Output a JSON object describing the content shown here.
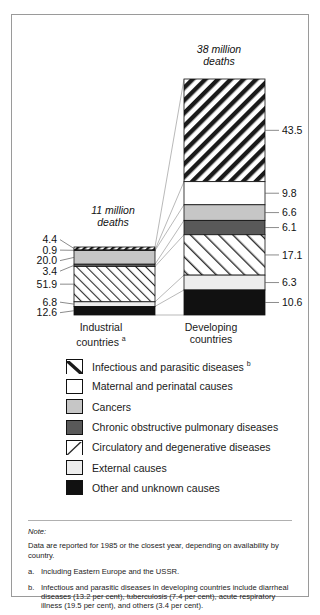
{
  "chart_data": {
    "type": "bar",
    "title": "",
    "subtitle": "",
    "xlabel": "",
    "ylabel": "",
    "stacked": true,
    "units": "per cent of deaths",
    "grid": false,
    "legend_position": "below",
    "categories": [
      "Industrial countries",
      "Developing countries"
    ],
    "category_notes": [
      "a",
      ""
    ],
    "totals": [
      "11 million deaths",
      "38 million deaths"
    ],
    "total_values": [
      11,
      38
    ],
    "series": [
      {
        "name": "Infectious and parasitic diseases",
        "note": "b",
        "pattern": "thick-backslash-hatch",
        "values": [
          4.4,
          43.5
        ]
      },
      {
        "name": "Maternal and perinatal causes",
        "note": "",
        "pattern": "white",
        "values": [
          0.9,
          9.8
        ]
      },
      {
        "name": "Cancers",
        "note": "",
        "pattern": "light-gray",
        "values": [
          20.0,
          6.6
        ]
      },
      {
        "name": "Chronic obstructive pulmonary diseases",
        "note": "",
        "pattern": "dark-gray",
        "values": [
          3.4,
          6.1
        ]
      },
      {
        "name": "Circulatory and degenerative diseases",
        "note": "",
        "pattern": "thin-slash-hatch",
        "values": [
          51.9,
          17.1
        ]
      },
      {
        "name": "External causes",
        "note": "",
        "pattern": "very-light-gray",
        "values": [
          6.8,
          6.3
        ]
      },
      {
        "name": "Other and unknown causes",
        "note": "",
        "pattern": "black",
        "values": [
          12.6,
          10.6
        ]
      }
    ]
  },
  "notes": {
    "heading": "Note:",
    "body": "Data are reported for 1985 or the closest year, depending on availability by country.",
    "footnotes": [
      {
        "marker": "a.",
        "text": "Including Eastern Europe and the USSR."
      },
      {
        "marker": "b.",
        "text": "Infectious and parasitic diseases in developing countries include diarrheal diseases (13.2 per cent), tuberculosis (7.4 per cent), acute respiratory illness (19.5 per cent), and others (3.4 per cent)."
      }
    ]
  },
  "colors": {
    "light_gray": "#c6c6c6",
    "dark_gray": "#595959",
    "very_light_gray": "#ededed",
    "black": "#111111",
    "white": "#ffffff",
    "outline": "#111111",
    "border": "#9a9a9a"
  }
}
